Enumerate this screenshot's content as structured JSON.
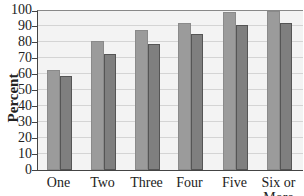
{
  "chart_data": {
    "type": "bar",
    "title": "",
    "xlabel": "",
    "ylabel": "Percent",
    "ylim": [
      0,
      100
    ],
    "yticks": [
      0,
      10,
      20,
      30,
      40,
      50,
      60,
      70,
      80,
      90,
      100
    ],
    "grid": true,
    "legend": null,
    "categories": [
      "One",
      "Two",
      "Three",
      "Four",
      "Five",
      "Six or More"
    ],
    "series": [
      {
        "name": "Series 1 (lighter)",
        "color": "#9b9b9b",
        "values": [
          63,
          81,
          88,
          92,
          99,
          100
        ]
      },
      {
        "name": "Series 2 (darker)",
        "color": "#7f7f7f",
        "values": [
          59,
          73,
          79,
          85,
          91,
          92
        ]
      }
    ]
  },
  "labels": {
    "ylabel": "Percent",
    "yticks": [
      "0",
      "10",
      "20",
      "30",
      "40",
      "50",
      "60",
      "70",
      "80",
      "90",
      "100"
    ],
    "categories": [
      "One",
      "Two",
      "Three",
      "Four",
      "Five",
      "Six or",
      "More"
    ]
  }
}
